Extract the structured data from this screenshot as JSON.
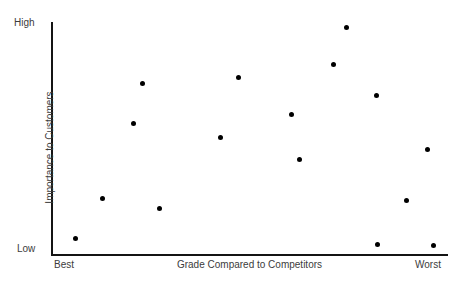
{
  "chart_data": {
    "type": "scatter",
    "title": "",
    "xlabel": "Grade Compared to Competitors",
    "ylabel": "Importance to Customers",
    "xlim": [
      0,
      100
    ],
    "ylim": [
      0,
      100
    ],
    "grid": false,
    "legend": null,
    "x_tick_labels": [
      "Best",
      "Worst"
    ],
    "y_tick_labels": [
      "Low",
      "High"
    ],
    "marker": {
      "shape": "circle",
      "color": "#000000",
      "size_px": 5
    },
    "axis_color": "#141414",
    "text_color": "#3c3c3c",
    "background": "#ffffff",
    "points": [
      {
        "x": 5.8,
        "y": 92.7
      },
      {
        "x": 12.4,
        "y": 75.9
      },
      {
        "x": 20.3,
        "y": 43.5
      },
      {
        "x": 22.5,
        "y": 26.3
      },
      {
        "x": 26.8,
        "y": 80.2
      },
      {
        "x": 42.3,
        "y": 49.6
      },
      {
        "x": 46.8,
        "y": 23.3
      },
      {
        "x": 60.3,
        "y": 60.3
      },
      {
        "x": 62.3,
        "y": 79.7
      },
      {
        "x": 70.9,
        "y": 16.4
      },
      {
        "x": 74.2,
        "y": 0.0
      },
      {
        "x": 81.8,
        "y": 29.3
      },
      {
        "x": 82.0,
        "y": 95.3
      },
      {
        "x": 89.4,
        "y": 76.3
      },
      {
        "x": 94.7,
        "y": 54.7
      },
      {
        "x": 96.2,
        "y": 95.7
      }
    ],
    "pixel_points": [
      {
        "left": 22,
        "top": 216
      },
      {
        "left": 49,
        "top": 176
      },
      {
        "left": 80,
        "top": 101
      },
      {
        "left": 89,
        "top": 61
      },
      {
        "left": 106,
        "top": 186
      },
      {
        "left": 167,
        "top": 115
      },
      {
        "left": 185,
        "top": 55
      },
      {
        "left": 238,
        "top": 92
      },
      {
        "left": 246,
        "top": 137
      },
      {
        "left": 280,
        "top": 42
      },
      {
        "left": 293,
        "top": 5
      },
      {
        "left": 323,
        "top": 73
      },
      {
        "left": 324,
        "top": 222
      },
      {
        "left": 353,
        "top": 178
      },
      {
        "left": 374,
        "top": 127
      },
      {
        "left": 380,
        "top": 223
      }
    ]
  },
  "axes": {
    "y_top_label": "High",
    "y_bottom_label": "Low",
    "y_title": "Importance to Customers",
    "x_left_label": "Best",
    "x_right_label": "Worst",
    "x_title": "Grade Compared to Competitors"
  }
}
